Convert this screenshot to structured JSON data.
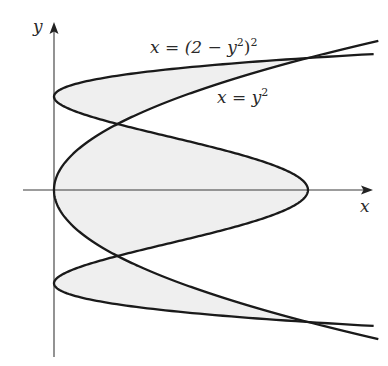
{
  "chart_data": {
    "type": "line",
    "title": "",
    "xlabel": "x",
    "ylabel": "y",
    "grid": false,
    "xlim": [
      -0.5,
      5.0
    ],
    "ylim": [
      -2.6,
      2.5
    ],
    "series": [
      {
        "name": "x = (2 − y²)²",
        "equation": "x = (2 - y^2)^2",
        "y_range": [
          -2.06,
          2.06
        ],
        "key_points": [
          [
            4,
            0
          ],
          [
            0,
            1.414
          ],
          [
            0,
            -1.414
          ],
          [
            1,
            1
          ],
          [
            1,
            -1
          ],
          [
            4,
            2
          ],
          [
            4,
            -2
          ]
        ]
      },
      {
        "name": "x = y²",
        "equation": "x = y^2",
        "y_range": [
          -2.26,
          2.26
        ],
        "key_points": [
          [
            0,
            0
          ],
          [
            1,
            1
          ],
          [
            1,
            -1
          ],
          [
            4,
            2
          ],
          [
            4,
            -2
          ]
        ]
      }
    ],
    "shaded_region": "area enclosed between the two curves for -2 ≤ y ≤ 2",
    "intersections": [
      [
        1,
        1
      ],
      [
        1,
        -1
      ],
      [
        4,
        2
      ],
      [
        4,
        -2
      ]
    ],
    "annotations": [
      {
        "text": "x = (2 − y²)²",
        "near": [
          3.0,
          2.1
        ]
      },
      {
        "text": "x = y²",
        "near": [
          3.0,
          1.4
        ]
      }
    ]
  },
  "labels": {
    "x_axis": "x",
    "y_axis": "y",
    "curve1_lhs": "x = (2 − y",
    "curve1_sup1": "2",
    "curve1_rhs": ")",
    "curve1_sup2": "2",
    "curve2_lhs": "x = y",
    "curve2_sup": "2"
  },
  "style": {
    "curve_color": "#1a1a1a",
    "axis_color": "#3a3a3a",
    "shade_color": "#efefef"
  },
  "mapping": {
    "origin_px": [
      54,
      190
    ],
    "x_px_per_unit": 63.5,
    "y_px_per_unit": 66
  }
}
